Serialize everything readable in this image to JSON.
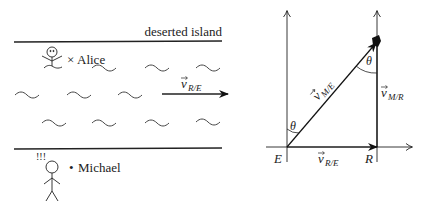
{
  "left_panel": {
    "island_label": "deserted island",
    "alice_label": "Alice",
    "alice_marker": "×",
    "michael_label": "Michael",
    "michael_marker": "•",
    "exclamation": "!!!",
    "river_velocity": {
      "symbol": "v",
      "subscript": "R/E"
    }
  },
  "right_panel": {
    "origin_label": "E",
    "corner_label": "R",
    "angle_label_bottom": "θ",
    "angle_label_top": "θ",
    "v_RE": {
      "symbol": "v",
      "subscript": "R/E"
    },
    "v_ME": {
      "symbol": "v",
      "subscript": "M/E"
    },
    "v_MR": {
      "symbol": "v",
      "subscript": "M/R"
    }
  },
  "colors": {
    "stroke": "#222222",
    "background": "#ffffff"
  }
}
